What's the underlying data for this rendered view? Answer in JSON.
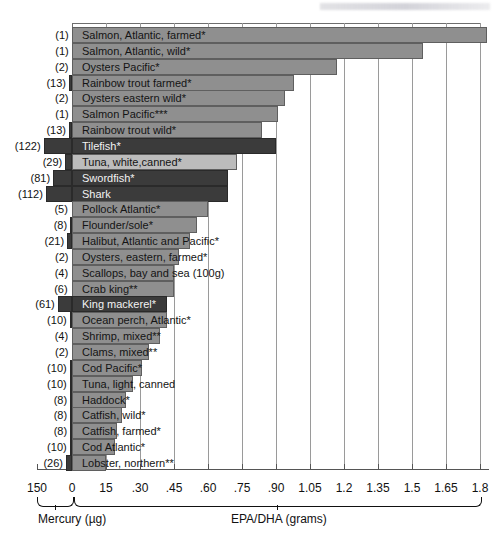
{
  "chart_data": {
    "type": "bar",
    "title": "",
    "xlabel_left": "Mercury (µg)",
    "xlabel_right": "EPA/DHA (grams)",
    "axis_ticks": [
      "150",
      "0",
      "15",
      ".30",
      ".45",
      ".60",
      ".75",
      ".90",
      "1.05",
      "1.2",
      "1.35",
      "1.5",
      "1.65",
      "1.8"
    ],
    "epa_axis_range": [
      0,
      1.8
    ],
    "mercury_axis_range": [
      0,
      150
    ],
    "grid": true,
    "legend_position": "none",
    "categories": [
      "Salmon, Atlantic, farmed*",
      "Salmon, Atlantic, wild*",
      "Oysters Pacific*",
      "Rainbow trout farmed*",
      "Oysters eastern wild*",
      "Salmon Pacific***",
      "Rainbow trout wild*",
      "Tilefish*",
      "Tuna, white,canned*",
      "Swordfish*",
      "Shark",
      "Pollock Atlantic*",
      "Flounder/sole*",
      "Halibut, Atlantic and Pacific*",
      "Oysters, eastern, farmed*",
      "Scallops, bay and sea (100g)",
      "Crab king**",
      "King mackerel*",
      "Ocean perch, Atlantic*",
      "Shrimp, mixed**",
      "Clams, mixed**",
      "Cod Pacific*",
      "Tuna, light, canned",
      "Haddock*",
      "Catfish, wild*",
      "Catfish, farmed*",
      "Cod Atlantic*",
      "Lobster, northern**"
    ],
    "mercury_values": [
      1,
      1,
      2,
      13,
      2,
      1,
      13,
      122,
      29,
      81,
      112,
      5,
      8,
      21,
      2,
      4,
      6,
      61,
      10,
      4,
      2,
      10,
      10,
      8,
      8,
      8,
      10,
      26
    ],
    "mercury_labels": [
      "(1)",
      "(1)",
      "(2)",
      "(13)",
      "(2)",
      "(1)",
      "(13)",
      "(122)",
      "(29)",
      "(81)",
      "(112)",
      "(5)",
      "(8)",
      "(21)",
      "(2)",
      "(4)",
      "(6)",
      "(61)",
      "(10)",
      "(4)",
      "(2)",
      "(10)",
      "(10)",
      "(8)",
      "(8)",
      "(8)",
      "(10)",
      "(26)"
    ],
    "epa_values": [
      1.83,
      1.55,
      1.17,
      0.98,
      0.94,
      0.91,
      0.84,
      0.9,
      0.73,
      0.69,
      0.69,
      0.6,
      0.55,
      0.52,
      0.47,
      0.45,
      0.45,
      0.42,
      0.42,
      0.39,
      0.34,
      0.31,
      0.27,
      0.24,
      0.22,
      0.2,
      0.19,
      0.15
    ],
    "series": [
      {
        "name": "EPA/DHA (grams)",
        "values": [
          1.83,
          1.55,
          1.17,
          0.98,
          0.94,
          0.91,
          0.84,
          0.9,
          0.73,
          0.69,
          0.69,
          0.6,
          0.55,
          0.52,
          0.47,
          0.45,
          0.45,
          0.42,
          0.42,
          0.39,
          0.34,
          0.31,
          0.27,
          0.24,
          0.22,
          0.2,
          0.19,
          0.15
        ]
      },
      {
        "name": "Mercury (µg)",
        "values": [
          1,
          1,
          2,
          13,
          2,
          1,
          13,
          122,
          29,
          81,
          112,
          5,
          8,
          21,
          2,
          4,
          6,
          61,
          10,
          4,
          2,
          10,
          10,
          8,
          8,
          8,
          10,
          26
        ]
      }
    ],
    "high_mercury_rows": [
      7,
      9,
      10,
      17
    ],
    "light_rows": [
      8
    ],
    "colors": {
      "bar_standard": "#8f8f8f",
      "bar_light": "#bcbcbc",
      "bar_dark": "#3b3b3b",
      "grid": "#9a9a9a",
      "axis": "#555555",
      "text": "#141414",
      "text_on_dark": "#f2f2f2",
      "background": "#ffffff"
    }
  }
}
